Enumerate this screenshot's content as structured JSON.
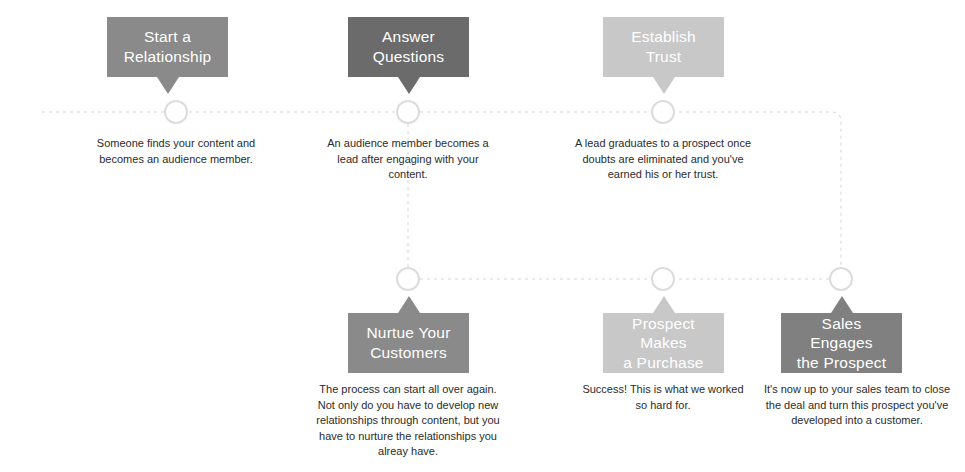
{
  "diagram": {
    "colors": {
      "box_medium": "#8a8a8a",
      "box_dark": "#6b6b6b",
      "box_light": "#c8c8c8",
      "box_mid_dark": "#808080",
      "line": "#e2e2e2",
      "node_ring": "#dcdcdc",
      "node_fill": "#ffffff",
      "label_text": "#ffffff",
      "caption_text": "#2b2b2b",
      "background": "#ffffff"
    },
    "steps": [
      {
        "id": "start-a-relationship",
        "label_line1": "Start a",
        "label_line2": "Relationship",
        "caption": "Someone finds your content and becomes an audience member.",
        "row": "top",
        "shade": "medium"
      },
      {
        "id": "answer-questions",
        "label_line1": "Answer",
        "label_line2": "Questions",
        "caption": "An audience member becomes a lead after engaging with your content.",
        "row": "top",
        "shade": "dark"
      },
      {
        "id": "establish-trust",
        "label_line1": "Establish",
        "label_line2": "Trust",
        "caption": "A lead graduates to a prospect once doubts are eliminated and you've earned his or her trust.",
        "row": "top",
        "shade": "light"
      },
      {
        "id": "nurtue-your-customers",
        "label_line1": "Nurtue Your",
        "label_line2": "Customers",
        "caption": "The process can start all over again. Not only do you have to develop new relationships through content, but you have to nurture the relationships you alreay have.",
        "row": "bottom",
        "shade": "medium"
      },
      {
        "id": "prospect-makes-a-purchase",
        "label_line1": "Prospect Makes",
        "label_line2": "a Purchase",
        "caption": "Success! This is what we worked so hard for.",
        "row": "bottom",
        "shade": "light"
      },
      {
        "id": "sales-engages-the-prospect",
        "label_line1": "Sales Engages",
        "label_line2": "the Prospect",
        "caption": "It's now up to your sales team to close the deal and turn this prospect you've developed into a customer.",
        "row": "bottom",
        "shade": "mid_dark"
      }
    ]
  }
}
